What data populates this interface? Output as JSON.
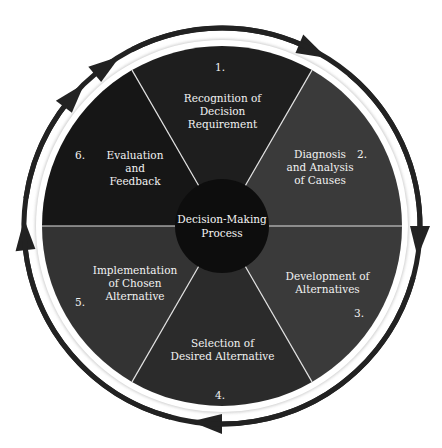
{
  "diagram": {
    "title": "Decision-Making Process",
    "center_label": "Decision-Making\nProcess",
    "steps": [
      {
        "number": "1.",
        "label": "Recognition of\nDecision\nRequirement",
        "color": "#1e1e1e"
      },
      {
        "number": "2.",
        "label": "Diagnosis\nand Analysis\nof Causes",
        "color": "#3a3a3a"
      },
      {
        "number": "3.",
        "label": "Development of\nAlternatives",
        "color": "#3a3a3a"
      },
      {
        "number": "4.",
        "label": "Selection of\nDesired Alternative",
        "color": "#2b2b2b"
      },
      {
        "number": "5.",
        "label": "Implementation\nof Chosen\nAlternative",
        "color": "#333333"
      },
      {
        "number": "6.",
        "label": "Evaluation\nand\nFeedback",
        "color": "#161616"
      }
    ],
    "colors": {
      "center_circle": "#0d0d0d",
      "divider": "#e0e0e0",
      "arrow": "#222222",
      "ring_gap": "#ffffff"
    },
    "flow_direction": "clockwise"
  }
}
